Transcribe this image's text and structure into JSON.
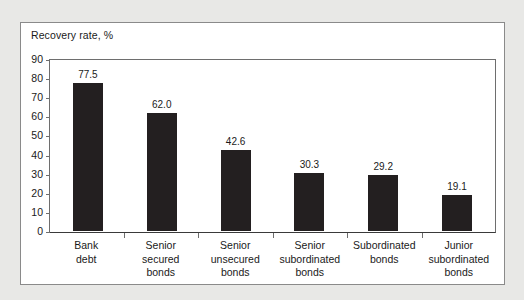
{
  "chart_data": {
    "type": "bar",
    "title": "Recovery rate, %",
    "xlabel": "",
    "ylabel": "Recovery rate, %",
    "ylim": [
      0,
      90
    ],
    "yticks": [
      90,
      80,
      70,
      60,
      50,
      40,
      30,
      20,
      10,
      0
    ],
    "grid": false,
    "legend": "none",
    "bar_color": "#231f20",
    "categories": [
      "Bank debt",
      "Senior secured bonds",
      "Senior unsecured bonds",
      "Senior subordinated bonds",
      "Subordinated bonds",
      "Junior subordinated bonds"
    ],
    "category_lines": [
      [
        "Bank",
        "debt"
      ],
      [
        "Senior",
        "secured",
        "bonds"
      ],
      [
        "Senior",
        "unsecured",
        "bonds"
      ],
      [
        "Senior",
        "subordinated",
        "bonds"
      ],
      [
        "Subordinated",
        "bonds"
      ],
      [
        "Junior",
        "subordinated",
        "bonds"
      ]
    ],
    "values": [
      77.5,
      62.0,
      42.6,
      30.3,
      29.2,
      19.1
    ],
    "value_labels": [
      "77.5",
      "62.0",
      "42.6",
      "30.3",
      "29.2",
      "19.1"
    ]
  }
}
